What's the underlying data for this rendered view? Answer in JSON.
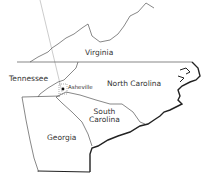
{
  "map": {
    "states": [
      {
        "name": "Virginia"
      },
      {
        "name": "Tennessee"
      },
      {
        "name": "North Carolina"
      },
      {
        "name": "South Carolina",
        "lines": [
          "South",
          "Carolina"
        ]
      },
      {
        "name": "Georgia"
      }
    ],
    "cities": [
      {
        "name": "Asheville"
      }
    ],
    "colors": {
      "border": "#555555",
      "coast": "#222222",
      "background": "#ffffff"
    }
  }
}
